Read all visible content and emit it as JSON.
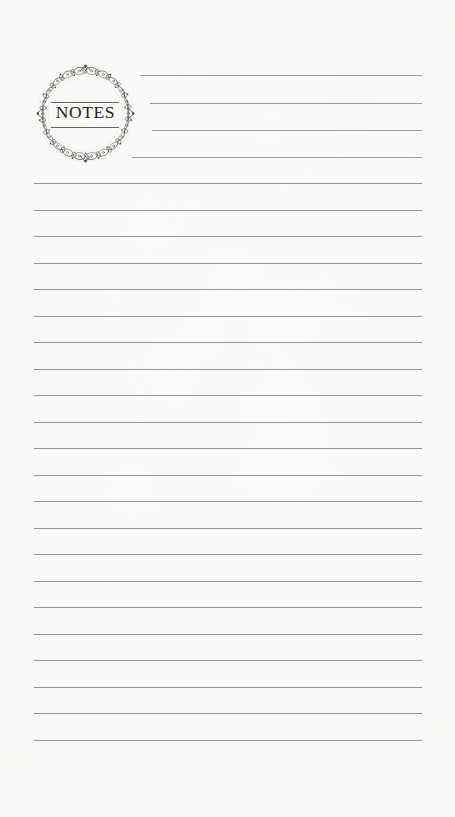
{
  "page": {
    "title": "NOTES",
    "width": 455,
    "height": 817,
    "background_color": "#fdfdfc",
    "rule_color": "#8c8c8c",
    "ink_color": "#23211f"
  },
  "emblem": {
    "label": "NOTES",
    "ornament_name": "filigree-wreath",
    "diameter_px": 105,
    "center_x": 85,
    "center_y": 113
  },
  "header_rules": [
    {
      "x": 140,
      "y": 75,
      "width": 282
    },
    {
      "x": 150,
      "y": 103,
      "width": 272
    },
    {
      "x": 152,
      "y": 130,
      "width": 270
    },
    {
      "x": 132,
      "y": 157,
      "width": 290
    }
  ],
  "body_rules": {
    "x": 34,
    "width": 388,
    "start_y": 183,
    "spacing": 26.5,
    "count": 22
  }
}
